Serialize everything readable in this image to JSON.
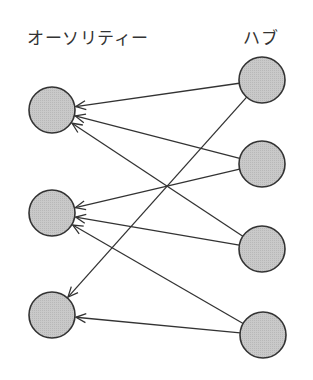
{
  "labels": {
    "authority": "オーソリティー",
    "hub": "ハブ"
  },
  "style": {
    "node_fill": "#c4c4c4",
    "node_stroke": "#333333",
    "edge_color": "#333333",
    "node_radius": 23
  },
  "nodes": {
    "authorities": [
      {
        "id": "A1",
        "cx": 52,
        "cy": 110
      },
      {
        "id": "A2",
        "cx": 52,
        "cy": 213
      },
      {
        "id": "A3",
        "cx": 52,
        "cy": 315
      }
    ],
    "hubs": [
      {
        "id": "H1",
        "cx": 262,
        "cy": 80
      },
      {
        "id": "H2",
        "cx": 262,
        "cy": 164
      },
      {
        "id": "H3",
        "cx": 262,
        "cy": 249
      },
      {
        "id": "H4",
        "cx": 263,
        "cy": 335
      }
    ]
  },
  "edges": [
    {
      "from": "H1",
      "to": "A1"
    },
    {
      "from": "H1",
      "to": "A3"
    },
    {
      "from": "H2",
      "to": "A1"
    },
    {
      "from": "H2",
      "to": "A2"
    },
    {
      "from": "H3",
      "to": "A1"
    },
    {
      "from": "H3",
      "to": "A2"
    },
    {
      "from": "H4",
      "to": "A2"
    },
    {
      "from": "H4",
      "to": "A3"
    }
  ]
}
